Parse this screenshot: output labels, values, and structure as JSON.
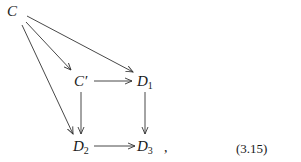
{
  "diagram": {
    "type": "commutative-diagram",
    "nodes": {
      "C": {
        "label": "C",
        "sub": ""
      },
      "Cprime": {
        "label": "C′",
        "sub": ""
      },
      "D1": {
        "label": "D",
        "sub": "1"
      },
      "D2": {
        "label": "D",
        "sub": "2"
      },
      "D3": {
        "label": "D",
        "sub": "3"
      }
    },
    "edges": [
      {
        "from": "C",
        "to": "Cprime"
      },
      {
        "from": "C",
        "to": "D1"
      },
      {
        "from": "C",
        "to": "D2"
      },
      {
        "from": "Cprime",
        "to": "D1"
      },
      {
        "from": "Cprime",
        "to": "D2"
      },
      {
        "from": "D1",
        "to": "D3"
      },
      {
        "from": "D2",
        "to": "D3"
      }
    ],
    "trailing_punct": ",",
    "equation_number": "(3.15)",
    "stroke_color": "#333333"
  }
}
